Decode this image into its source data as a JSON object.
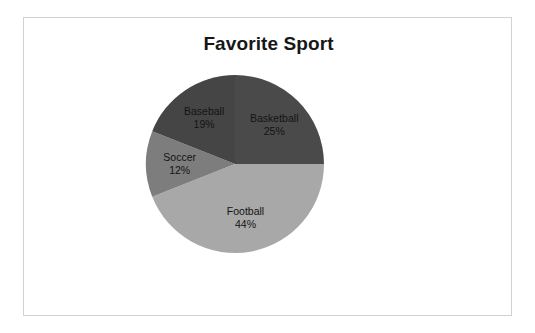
{
  "chart_data": {
    "type": "pie",
    "title": "Favorite Sport",
    "categories": [
      "Basketball",
      "Football",
      "Soccer",
      "Baseball"
    ],
    "values": [
      25,
      44,
      12,
      19
    ],
    "unit": "%",
    "labels": [
      "25%",
      "44%",
      "12%",
      "19%"
    ],
    "colors": [
      "#4a4a4a",
      "#a8a8a8",
      "#7d7d7d",
      "#454545"
    ],
    "start_angle_deg": 0,
    "direction": "clockwise",
    "legend": "none",
    "data_labels": "inside-slice",
    "slices": [
      {
        "name": "Basketball",
        "value": 25,
        "label": "25%",
        "color": "#4a4a4a"
      },
      {
        "name": "Football",
        "value": 44,
        "label": "44%",
        "color": "#a8a8a8"
      },
      {
        "name": "Soccer",
        "value": 12,
        "label": "12%",
        "color": "#7d7d7d"
      },
      {
        "name": "Baseball",
        "value": 19,
        "label": "19%",
        "color": "#454545"
      }
    ]
  },
  "frame": {
    "border_color": "#d2d2d2",
    "background": "#ffffff"
  }
}
